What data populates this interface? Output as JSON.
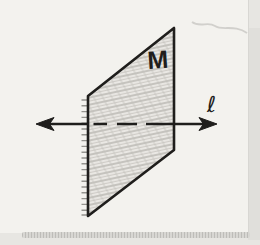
{
  "figure": {
    "plane_label": "M",
    "line_label": "ℓ"
  },
  "colors": {
    "ink": "#1f1e1c",
    "paper": "#f3f2ee",
    "outer_background": "#e7e6e2",
    "pencil_shading": "#bab8b3",
    "page_edge": "#b9b8b4"
  }
}
